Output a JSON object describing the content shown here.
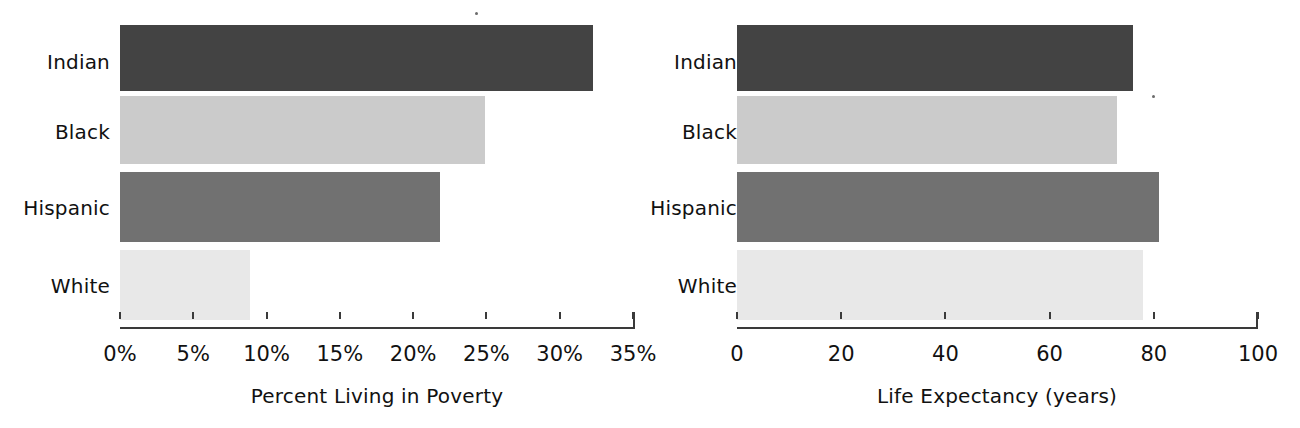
{
  "figure": {
    "background": "#ffffff",
    "panels": [
      "poverty",
      "life_expectancy"
    ]
  },
  "palette": {
    "indian": "#434343",
    "black": "#cbcbcb",
    "hispanic": "#717171",
    "white": "#e8e8e8",
    "axis": "#3a3a3a",
    "text": "#111111"
  },
  "labels": {
    "indian": "Indian",
    "black": "Black",
    "hispanic": "Hispanic",
    "white": "White"
  },
  "poverty": {
    "axis_title": "Percent Living in Poverty",
    "ticks": [
      "0%",
      "5%",
      "10%",
      "15%",
      "20%",
      "25%",
      "30%",
      "35%"
    ]
  },
  "life": {
    "axis_title": "Life Expectancy (years)",
    "ticks": [
      "0",
      "20",
      "40",
      "60",
      "80",
      "100"
    ]
  },
  "chart_data": [
    {
      "type": "bar",
      "orientation": "horizontal",
      "title": "",
      "xlabel": "Percent Living in Poverty",
      "ylabel": "",
      "categories": [
        "Indian",
        "Black",
        "Hispanic",
        "White"
      ],
      "values": [
        32.3,
        24.9,
        21.8,
        8.9
      ],
      "unit": "percent",
      "xlim": [
        0,
        35
      ],
      "xticks": [
        0,
        5,
        10,
        15,
        20,
        25,
        30,
        35
      ],
      "xticklabels": [
        "0%",
        "5%",
        "10%",
        "15%",
        "20%",
        "25%",
        "30%",
        "35%"
      ],
      "grid": false,
      "legend": "none",
      "bar_colors": [
        "#434343",
        "#cbcbcb",
        "#717171",
        "#e8e8e8"
      ]
    },
    {
      "type": "bar",
      "orientation": "horizontal",
      "title": "",
      "xlabel": "Life Expectancy (years)",
      "ylabel": "",
      "categories": [
        "Indian",
        "Black",
        "Hispanic",
        "White"
      ],
      "values": [
        76,
        73,
        81,
        78
      ],
      "unit": "years",
      "xlim": [
        0,
        100
      ],
      "xticks": [
        0,
        20,
        40,
        60,
        80,
        100
      ],
      "xticklabels": [
        "0",
        "20",
        "40",
        "60",
        "80",
        "100"
      ],
      "grid": false,
      "legend": "none",
      "bar_colors": [
        "#434343",
        "#cbcbcb",
        "#717171",
        "#e8e8e8"
      ]
    }
  ]
}
